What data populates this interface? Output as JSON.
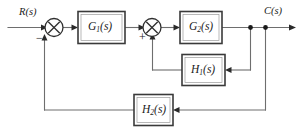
{
  "diagram": {
    "type": "control-system-block-diagram",
    "background_color": "#ffffff",
    "line_color": "#6e6e6e",
    "box_border_color": "#3a3a3a",
    "text_color": "#1b1b1b",
    "input": {
      "label_main": "R",
      "label_arg": "(s)",
      "full": "R(s)"
    },
    "output": {
      "label_main": "C",
      "label_arg": "(s)",
      "full": "C(s)"
    },
    "blocks": [
      {
        "id": "g1",
        "base": "G",
        "sub": "1",
        "arg": "(s)",
        "full": "G1(s)"
      },
      {
        "id": "g2",
        "base": "G",
        "sub": "2",
        "arg": "(s)",
        "full": "G2(s)"
      },
      {
        "id": "h1",
        "base": "H",
        "sub": "1",
        "arg": "(s)",
        "full": "H1(s)"
      },
      {
        "id": "h2",
        "base": "H",
        "sub": "2",
        "arg": "(s)",
        "full": "H2(s)"
      }
    ],
    "summing_junctions": [
      {
        "id": "sum1",
        "symbol": "cross-circle",
        "sign": "−",
        "sign_name": "minus"
      },
      {
        "id": "sum2",
        "symbol": "cross-circle",
        "sign": "+",
        "sign_name": "plus"
      }
    ],
    "feedback_loops": [
      {
        "id": "inner",
        "through": "H1(s)",
        "from": "C(s)",
        "to": "sum2",
        "sign": "+"
      },
      {
        "id": "outer",
        "through": "H2(s)",
        "from": "C(s)",
        "to": "sum1",
        "sign": "−"
      }
    ]
  }
}
